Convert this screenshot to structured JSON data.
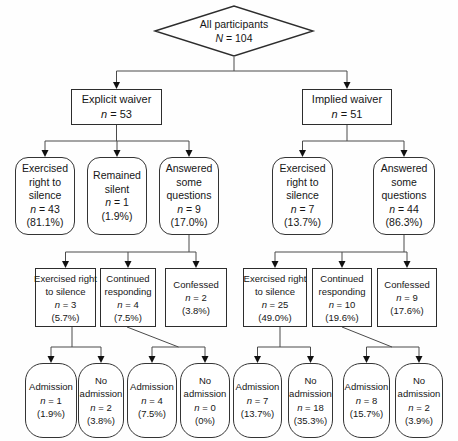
{
  "flowchart": {
    "root": {
      "label": "All participants",
      "n": "N = 104"
    },
    "waivers": [
      {
        "label": "Explicit waiver",
        "n": "n = 53"
      },
      {
        "label": "Implied waiver",
        "n": "n = 51"
      }
    ],
    "responses": [
      {
        "label": "Exercised\nright to\nsilence",
        "n": "n = 43",
        "pct": "(81.1%)"
      },
      {
        "label": "Remained\nsilent",
        "n": "n = 1",
        "pct": "(1.9%)"
      },
      {
        "label": "Answered\nsome\nquestions",
        "n": "n = 9",
        "pct": "(17.0%)"
      },
      {
        "label": "Exercised\nright to\nsilence",
        "n": "n = 7",
        "pct": "(13.7%)"
      },
      {
        "label": "Answered\nsome\nquestions",
        "n": "n = 44",
        "pct": "(86.3%)"
      }
    ],
    "outcomes": [
      {
        "label": "Exercised right\nto silence",
        "n": "n = 3",
        "pct": "(5.7%)"
      },
      {
        "label": "Continued\nresponding",
        "n": "n = 4",
        "pct": "(7.5%)"
      },
      {
        "label": "Confessed",
        "n": "n = 2",
        "pct": "(3.8%)"
      },
      {
        "label": "Exercised right\nto silence",
        "n": "n = 25",
        "pct": "(49.0%)"
      },
      {
        "label": "Continued\nresponding",
        "n": "n = 10",
        "pct": "(19.6%)"
      },
      {
        "label": "Confessed",
        "n": "n = 9",
        "pct": "(17.6%)"
      }
    ],
    "admissions": [
      {
        "label": "Admission",
        "n": "n = 1",
        "pct": "(1.9%)"
      },
      {
        "label": "No\nadmission",
        "n": "n = 2",
        "pct": "(3.8%)"
      },
      {
        "label": "Admission",
        "n": "n = 4",
        "pct": "(7.5%)"
      },
      {
        "label": "No\nadmission",
        "n": "n = 0",
        "pct": "(0%)"
      },
      {
        "label": "Admission",
        "n": "n = 7",
        "pct": "(13.7%)"
      },
      {
        "label": "No\nadmission",
        "n": "n = 18",
        "pct": "(35.3%)"
      },
      {
        "label": "Admission",
        "n": "n = 8",
        "pct": "(15.7%)"
      },
      {
        "label": "No\nadmission",
        "n": "n = 2",
        "pct": "(3.9%)"
      }
    ]
  }
}
